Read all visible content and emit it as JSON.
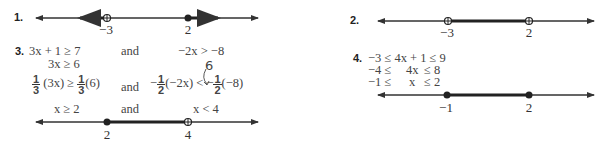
{
  "problems": [
    {
      "number": "1.",
      "number_line": {
        "labels": [
          "−3",
          "2"
        ],
        "points": [
          {
            "value": "-3",
            "type": "open"
          },
          {
            "value": "2",
            "type": "closed"
          }
        ],
        "shading": "x < -3 or x ≥ 2"
      }
    },
    {
      "number": "2.",
      "number_line": {
        "labels": [
          "−3",
          "2"
        ],
        "points": [
          {
            "value": "-3",
            "type": "open"
          },
          {
            "value": "2",
            "type": "open"
          }
        ],
        "shading": "-3 < x < 2"
      }
    },
    {
      "number": "3.",
      "steps": {
        "left": [
          "3x + 1 ≥ 7",
          "3x ≥ 6",
          "(3x) ≥",
          "(6)",
          "x ≥ 2"
        ],
        "connector": "and",
        "right": [
          "−2x > −8",
          "(−2x) <",
          "(−8)",
          "x < 4"
        ],
        "fraction_left": {
          "num": "1",
          "den": "3"
        },
        "fraction_right": {
          "num": "1",
          "den": "2"
        },
        "handwritten_note": "6"
      },
      "number_line": {
        "labels": [
          "2",
          "4"
        ],
        "points": [
          {
            "value": "2",
            "type": "closed"
          },
          {
            "value": "4",
            "type": "open"
          }
        ],
        "shading": "2 ≤ x < 4"
      }
    },
    {
      "number": "4.",
      "steps": [
        "−3 ≤ 4x + 1 ≤ 9",
        "−4 ≤",
        "4x",
        "≤ 8",
        "−1 ≤",
        "x",
        "≤ 2"
      ],
      "number_line": {
        "labels": [
          "−1",
          "2"
        ],
        "points": [
          {
            "value": "-1",
            "type": "closed"
          },
          {
            "value": "2",
            "type": "closed"
          }
        ],
        "shading": "-1 ≤ x ≤ 2"
      }
    }
  ],
  "colors": {
    "line": "#333333",
    "shade": "#222222",
    "text": "#444444"
  }
}
